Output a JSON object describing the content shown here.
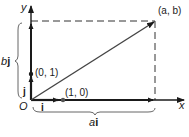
{
  "diagram": {
    "axes": {
      "x_label": "x",
      "y_label": "y",
      "origin_label": "O"
    },
    "points": {
      "ab": {
        "label": "(a, b)"
      },
      "zero_one": {
        "label": "(0, 1)"
      },
      "one_zero": {
        "label": "(1, 0)"
      }
    },
    "unit_vectors": {
      "i_label": "i",
      "j_label": "j"
    },
    "braces": {
      "vertical": {
        "coef": "b",
        "vec": "j"
      },
      "horizontal": {
        "coef": "a",
        "vec": "i"
      }
    },
    "colors": {
      "ink": "#1a1a1a",
      "vector": "#444444",
      "dashed": "#333333"
    }
  }
}
